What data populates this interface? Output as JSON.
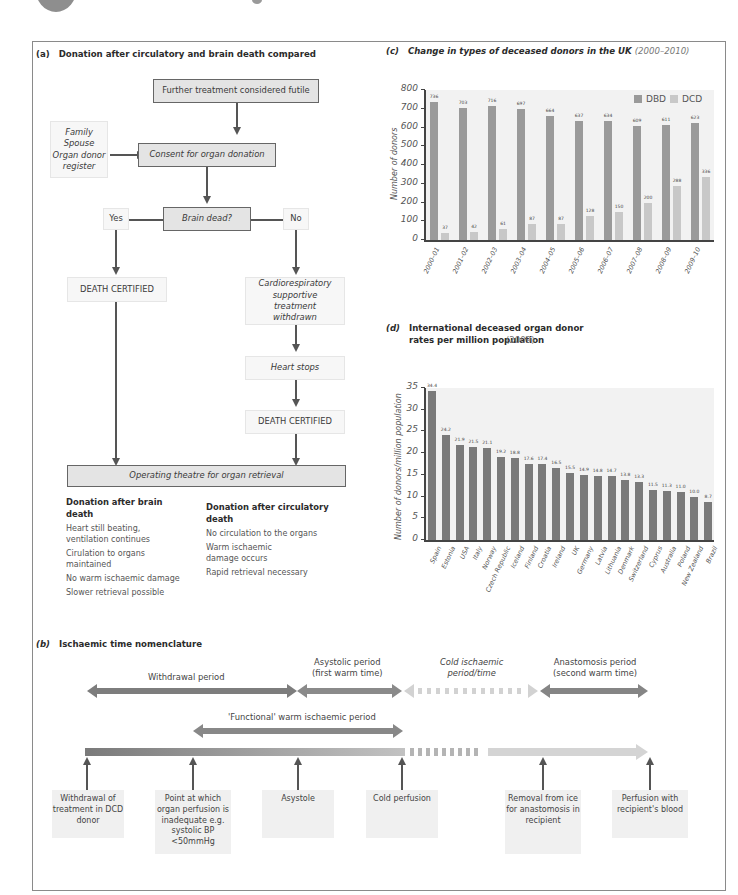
{
  "panel_a": {
    "title_letter": "(a)",
    "title": "Donation after circulatory and brain death compared",
    "nodes": {
      "futile": "Further treatment considered futile",
      "consent": "Consent for organ donation",
      "consent_sources": [
        "Family",
        "Spouse",
        "Organ donor register"
      ],
      "brain_dead": "Brain dead?",
      "yes": "Yes",
      "no": "No",
      "death_certified_left": "DEATH CERTIFIED",
      "withdrawn": "Cardiorespiratory supportive treatment withdrawn",
      "heart_stops": "Heart stops",
      "death_certified_right": "DEATH CERTIFIED",
      "operating": "Operating theatre for organ retrieval"
    },
    "dbd": {
      "heading": "Donation after brain death",
      "items": [
        "Heart still beating, ventilation continues",
        "Cirulation to organs maintained",
        "No warm ischaemic damage",
        "Slower retrieval possible"
      ]
    },
    "dcd": {
      "heading": "Donation after circulatory death",
      "items": [
        "No circulation to the organs",
        "Warm ischaemic damage occurs",
        "Rapid retrieval necessary"
      ]
    }
  },
  "panel_b": {
    "title_letter": "(b)",
    "title": "Ischaemic time nomenclature",
    "periods": {
      "withdrawal": "Withdrawal period",
      "asystolic_1": "Asystolic period",
      "asystolic_2": "(first warm time)",
      "cold_1": "Cold ischaemic",
      "cold_2": "period/time",
      "anastomosis_1": "Anastomosis period",
      "anastomosis_2": "(second warm time)",
      "functional": "'Functional' warm ischaemic period"
    },
    "events": [
      "Withdrawal of treatment in DCD donor",
      "Point at which organ perfusion is inadequate e.g. systolic BP <50mmHg",
      "Asystole",
      "Cold perfusion",
      "Removal from ice for anastomosis in recipient",
      "Perfusion with recipient's blood"
    ]
  },
  "chart_data": [
    {
      "type": "bar",
      "panel": "(c)",
      "title": "Change in types of deceased donors in the UK",
      "subtitle": "(2000–2010)",
      "xlabel": "",
      "ylabel": "Number of donors",
      "ylim": [
        0,
        800
      ],
      "yticks": [
        0,
        100,
        200,
        300,
        400,
        500,
        600,
        700,
        800
      ],
      "legend_position": "top-right",
      "categories": [
        "2000–01",
        "2001–02",
        "2002–03",
        "2003–04",
        "2004–05",
        "2005–06",
        "2006–07",
        "2007–08",
        "2008–09",
        "2009–10"
      ],
      "series": [
        {
          "name": "DBD",
          "color": "#9a9a9a",
          "values": [
            736,
            703,
            716,
            697,
            664,
            637,
            634,
            609,
            611,
            623
          ]
        },
        {
          "name": "DCD",
          "color": "#c8c8c8",
          "values": [
            37,
            42,
            61,
            87,
            87,
            128,
            150,
            200,
            288,
            336
          ]
        }
      ]
    },
    {
      "type": "bar",
      "panel": "(d)",
      "title": "International deceased organ donor rates per million population",
      "subtitle": "(2009)",
      "xlabel": "",
      "ylabel": "Number of donors/million population",
      "ylim": [
        0,
        35
      ],
      "yticks": [
        0,
        5,
        10,
        15,
        20,
        25,
        30,
        35
      ],
      "categories": [
        "Spain",
        "Estonia",
        "USA",
        "Italy",
        "Norway",
        "Czech Republic",
        "Iceland",
        "Finland",
        "Croatia",
        "Ireland",
        "UK",
        "Germany",
        "Latvia",
        "Lithuania",
        "Denmark",
        "Switzerland",
        "Cyprus",
        "Australia",
        "Poland",
        "New Zealand",
        "Brazil"
      ],
      "values": [
        34.4,
        24.2,
        21.9,
        21.5,
        21.1,
        19.2,
        18.8,
        17.6,
        17.4,
        16.5,
        15.5,
        14.9,
        14.8,
        14.7,
        13.8,
        13.3,
        11.5,
        11.3,
        11.0,
        10.0,
        8.7
      ],
      "color": "#7a7a7a"
    }
  ],
  "colors": {
    "box_dark": "#e4e4e4",
    "box_light": "#f7f7f7",
    "line": "#555555",
    "timeline_dark": "#7d7d7d",
    "timeline_light": "#cfcfcf"
  }
}
